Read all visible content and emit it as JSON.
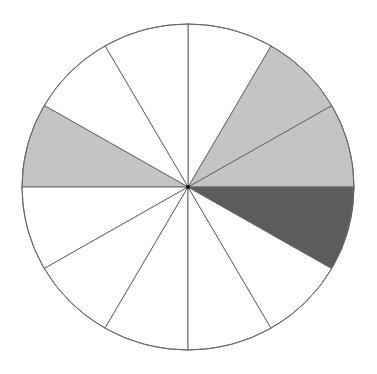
{
  "diagram": {
    "type": "fraction-circle",
    "center": [
      188,
      187
    ],
    "radius_x": 166,
    "radius_y": 163,
    "sector_count": 12,
    "sector_angle_deg": 30,
    "outline_color": "#6a6a6a",
    "colors": {
      "white": "#ffffff",
      "light": "#c4c4c4",
      "dark": "#5c5c5c"
    },
    "sectors": [
      {
        "index": 0,
        "start_deg": 0,
        "end_deg": 30,
        "fill": "light"
      },
      {
        "index": 1,
        "start_deg": 30,
        "end_deg": 60,
        "fill": "light"
      },
      {
        "index": 2,
        "start_deg": 60,
        "end_deg": 90,
        "fill": "white"
      },
      {
        "index": 3,
        "start_deg": 90,
        "end_deg": 120,
        "fill": "white"
      },
      {
        "index": 4,
        "start_deg": 120,
        "end_deg": 150,
        "fill": "white"
      },
      {
        "index": 5,
        "start_deg": 150,
        "end_deg": 180,
        "fill": "light"
      },
      {
        "index": 6,
        "start_deg": 180,
        "end_deg": 210,
        "fill": "white"
      },
      {
        "index": 7,
        "start_deg": 210,
        "end_deg": 240,
        "fill": "white"
      },
      {
        "index": 8,
        "start_deg": 240,
        "end_deg": 270,
        "fill": "white"
      },
      {
        "index": 9,
        "start_deg": 270,
        "end_deg": 300,
        "fill": "white"
      },
      {
        "index": 10,
        "start_deg": 300,
        "end_deg": 330,
        "fill": "white"
      },
      {
        "index": 11,
        "start_deg": 330,
        "end_deg": 360,
        "fill": "dark"
      }
    ],
    "summary": {
      "light_shaded": 3,
      "dark_shaded": 1,
      "unshaded": 8,
      "total": 12
    }
  }
}
